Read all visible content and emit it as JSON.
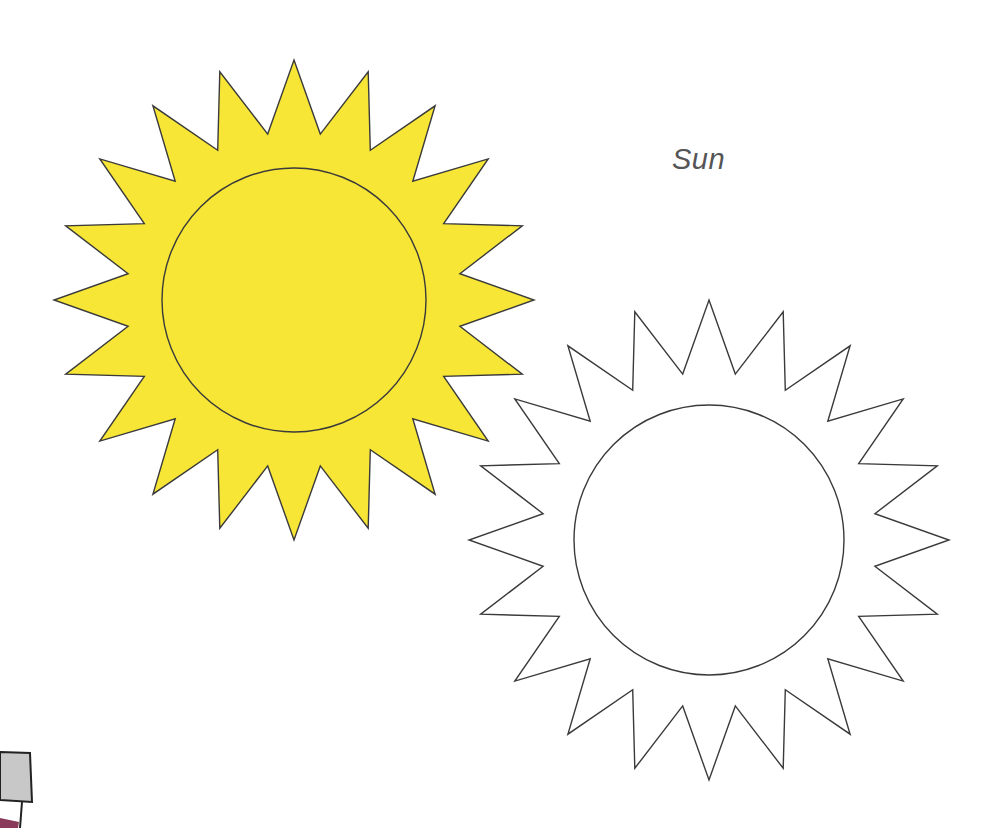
{
  "page": {
    "title": "Sun"
  },
  "colors": {
    "sun_fill": "#F7E636",
    "outline": "#3a3a3a",
    "background": "#ffffff",
    "title_text": "#555555",
    "partial_object_fill": "#c8c8c8"
  },
  "figures": [
    {
      "name": "colored-sun",
      "fill": "#F7E636",
      "rays": 20,
      "center": [
        294,
        300
      ],
      "outer_radius": 240,
      "inner_radius": 168,
      "disc_radius": 132
    },
    {
      "name": "outline-sun",
      "fill": "#ffffff",
      "rays": 20,
      "center": [
        709,
        540
      ],
      "outer_radius": 240,
      "inner_radius": 168,
      "disc_radius": 135
    }
  ]
}
